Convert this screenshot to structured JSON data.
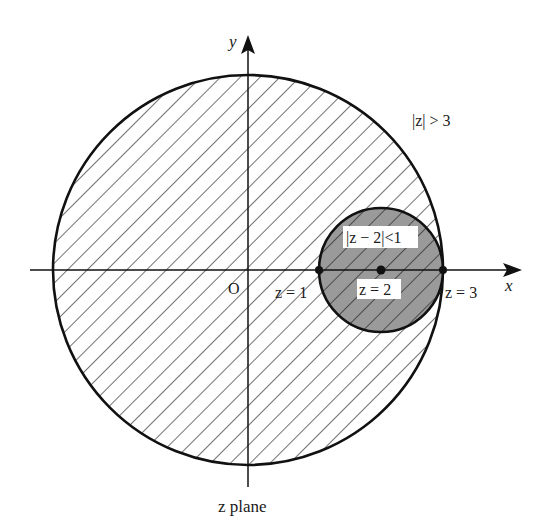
{
  "diagram": {
    "title": "z plane",
    "axes": {
      "x_label": "x",
      "y_label": "y",
      "origin_label": "O"
    },
    "regions": {
      "outer": {
        "label": "|z| > 3",
        "description": "exterior of circle of radius 3 centered at origin; interior shown hatched"
      },
      "inner": {
        "label": "|z − 2|<1",
        "description": "disk of radius 1 centered at z = 2, shaded gray"
      }
    },
    "points": [
      {
        "label": "z = 1",
        "x": 1
      },
      {
        "label": "z = 2",
        "x": 2
      },
      {
        "label": "z = 3",
        "x": 3
      }
    ],
    "colors": {
      "stroke": "#111111",
      "inner_fill": "#9a9a9a",
      "background": "#ffffff"
    }
  }
}
